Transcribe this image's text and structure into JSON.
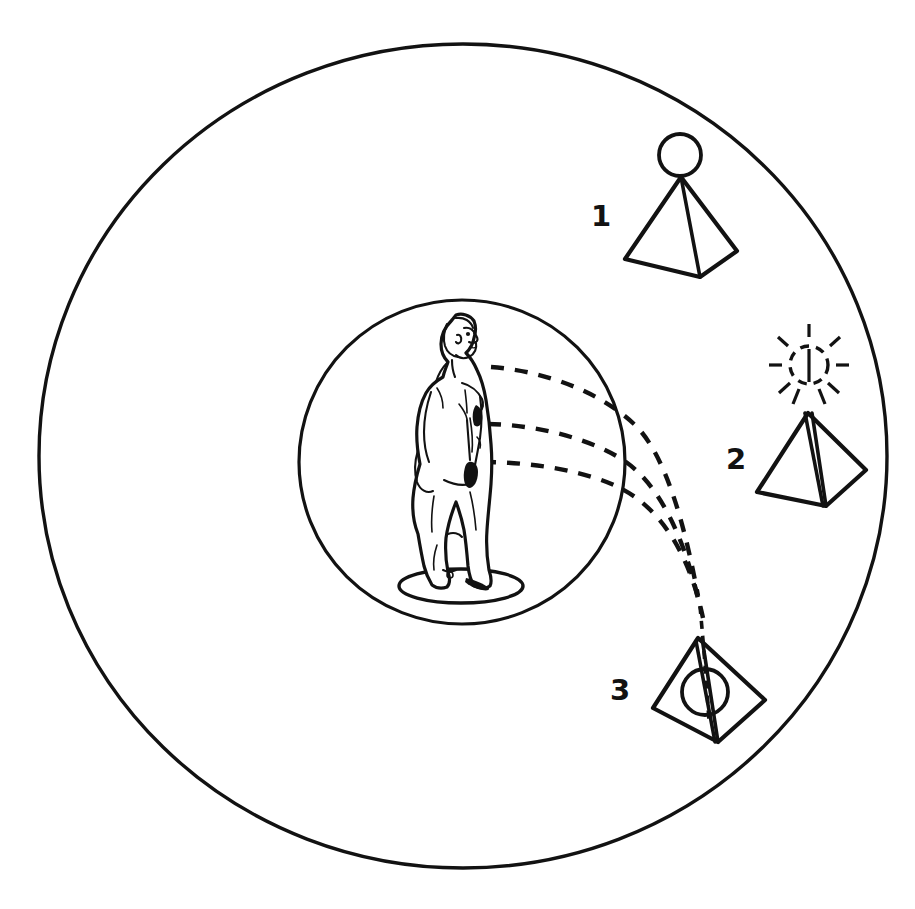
{
  "diagram": {
    "background_color": "#ffffff",
    "ink_color": "#121212",
    "canvas": {
      "width": 915,
      "height": 909
    },
    "outer_circle": {
      "name": "outer-field-circle",
      "cx": 463,
      "cy": 456,
      "rx": 424,
      "ry": 412
    },
    "inner_circle": {
      "name": "inner-field-circle",
      "cx": 462,
      "cy": 462,
      "rx": 163,
      "ry": 162
    },
    "center_figure": {
      "name": "human-figure",
      "description": "standing nude male figure in right-facing profile",
      "platform": {
        "cx": 461,
        "cy": 586,
        "rx": 62,
        "ry": 17
      }
    },
    "emission_lines": [
      {
        "name": "dashed-line-head",
        "origin": "head-level",
        "origin_x": 490,
        "origin_y": 367
      },
      {
        "name": "dashed-line-chest",
        "origin": "chest-level",
        "origin_x": 487,
        "origin_y": 424
      },
      {
        "name": "dashed-line-hip",
        "origin": "hip-level",
        "origin_x": 482,
        "origin_y": 462
      }
    ],
    "nodes": [
      {
        "id": "1",
        "label": "1",
        "name": "pyramid-stage-1",
        "description": "pyramid with separate circle resting above the apex",
        "label_x": 601,
        "label_y": 216,
        "apex_x": 681,
        "apex_y": 177,
        "base_left_x": 625,
        "base_left_y": 259,
        "base_right_x": 737,
        "base_right_y": 251,
        "base_front_x": 700,
        "base_front_y": 277,
        "orb": {
          "cx": 680,
          "cy": 155,
          "r": 21,
          "style": "solid",
          "position": "above-apex"
        },
        "rays": false
      },
      {
        "id": "2",
        "label": "2",
        "name": "pyramid-stage-2",
        "description": "pyramid with dashed radiating circle above the apex",
        "label_x": 736,
        "label_y": 459,
        "apex_x": 808,
        "apex_y": 413,
        "base_left_x": 757,
        "base_left_y": 492,
        "base_right_x": 866,
        "base_right_y": 470,
        "base_front_x": 826,
        "base_front_y": 506,
        "orb": {
          "cx": 809,
          "cy": 365,
          "r": 19,
          "style": "dashed",
          "position": "above-apex"
        },
        "rays": true,
        "ray_count": 10
      },
      {
        "id": "3",
        "label": "3",
        "name": "pyramid-stage-3",
        "description": "tilted pyramid with the circle absorbed inside its body",
        "label_x": 620,
        "label_y": 690,
        "apex_x": 698,
        "apex_y": 638,
        "base_left_x": 653,
        "base_left_y": 708,
        "base_right_x": 765,
        "base_right_y": 700,
        "base_front_x": 718,
        "base_front_y": 742,
        "orb": {
          "cx": 705,
          "cy": 692,
          "r": 22,
          "style": "solid",
          "position": "inside-pyramid"
        },
        "rays": false
      }
    ]
  }
}
